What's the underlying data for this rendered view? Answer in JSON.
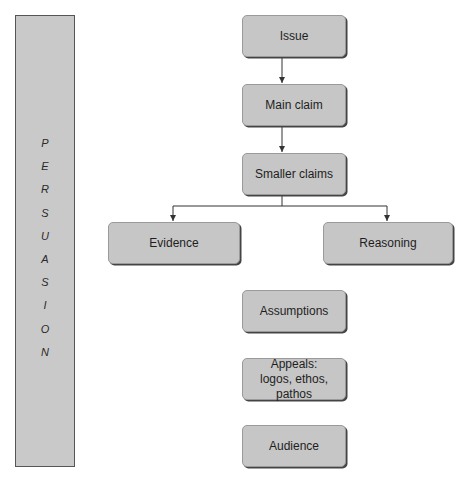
{
  "sidebar": {
    "title": "PERSUASION",
    "letters": [
      "P",
      "E",
      "R",
      "S",
      "U",
      "A",
      "S",
      "I",
      "O",
      "N"
    ]
  },
  "flow": {
    "issue": "Issue",
    "main_claim": "Main claim",
    "smaller_claims": "Smaller claims",
    "evidence": "Evidence",
    "reasoning": "Reasoning",
    "assumptions": "Assumptions",
    "appeals_line1": "Appeals:",
    "appeals_line2": "logos, ethos, pathos",
    "audience": "Audience"
  },
  "colors": {
    "box_fill": "#c6c6c6",
    "sidebar_fill": "#c9c9c9",
    "line": "#333333"
  }
}
